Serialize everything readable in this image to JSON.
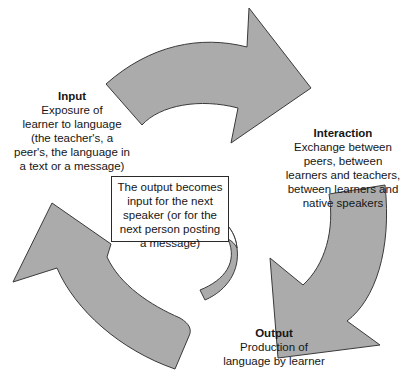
{
  "diagram": {
    "type": "cycle",
    "colors": {
      "arrow_fill": "#ababab",
      "arrow_stroke": "#3a3a3a",
      "background": "#ffffff",
      "text": "#161616"
    },
    "stages": [
      {
        "id": "input",
        "title": "Input",
        "description": "Exposure of learner to language (the teacher's, a peer's, the language in a text or a message)",
        "lines": [
          "Exposure of",
          "learner to language",
          "(the teacher's, a",
          "peer's, the language in",
          "a text or a message)"
        ]
      },
      {
        "id": "interaction",
        "title": "Interaction",
        "description": "Exchange between peers, between learners and teachers, between learners and native speakers",
        "lines": [
          "Exchange between",
          "peers, between",
          "learners and teachers,",
          "between learners and",
          "native speakers"
        ]
      },
      {
        "id": "output",
        "title": "Output",
        "description": "Production of language by learner",
        "lines": [
          "Production of",
          "language by learner"
        ]
      }
    ],
    "note": {
      "text": "The output becomes input for the next speaker (or for the next person posting a message)",
      "lines": [
        "The output becomes",
        "input for the next",
        "speaker (or for the",
        "next person posting",
        "a message)"
      ]
    },
    "arrows": [
      {
        "from": "input",
        "to": "interaction"
      },
      {
        "from": "interaction",
        "to": "output"
      },
      {
        "from": "output",
        "to": "input"
      },
      {
        "from": "output",
        "to": "note",
        "style": "small-curved"
      }
    ]
  }
}
